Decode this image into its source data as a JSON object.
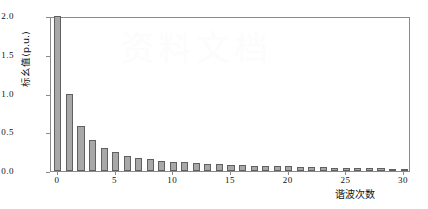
{
  "chart_data": {
    "type": "bar",
    "title": "",
    "xlabel": "谐波次数",
    "ylabel": "标幺值(p.u.)",
    "xlim": [
      -0.6,
      30.6
    ],
    "ylim": [
      0.0,
      2.0
    ],
    "grid": false,
    "legend": null,
    "bar_color": "#a8a8a8",
    "bar_edge_color": "#606060",
    "axis_color": "#8a8a8a",
    "categories": [
      0,
      1,
      2,
      3,
      4,
      5,
      6,
      7,
      8,
      9,
      10,
      11,
      12,
      13,
      14,
      15,
      16,
      17,
      18,
      19,
      20,
      21,
      22,
      23,
      24,
      25,
      26,
      27,
      28,
      29,
      30
    ],
    "values": [
      2.0,
      1.0,
      0.58,
      0.4,
      0.3,
      0.24,
      0.2,
      0.17,
      0.15,
      0.13,
      0.12,
      0.11,
      0.1,
      0.095,
      0.088,
      0.082,
      0.076,
      0.071,
      0.067,
      0.063,
      0.059,
      0.055,
      0.051,
      0.047,
      0.044,
      0.041,
      0.038,
      0.035,
      0.033,
      0.031,
      0.029
    ],
    "xticks": [
      0,
      5,
      10,
      15,
      20,
      25,
      30
    ],
    "xtick_labels": [
      "0",
      "5",
      "10",
      "15",
      "20",
      "25",
      "30"
    ],
    "yticks": [
      0.0,
      0.5,
      1.0,
      1.5,
      2.0
    ],
    "ytick_labels": [
      "0.0",
      "0.5",
      "1.0",
      "1.5",
      "2.0"
    ]
  },
  "watermark": {
    "text": "资料文档"
  }
}
